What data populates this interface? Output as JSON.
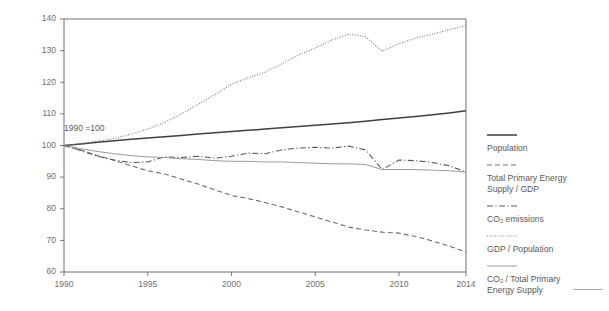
{
  "chart_data": {
    "type": "line",
    "title": "",
    "subtitle": "",
    "xlabel": "",
    "ylabel": "",
    "annotation": "1990 =100",
    "xlim": [
      1990,
      2014
    ],
    "ylim": [
      60,
      140
    ],
    "xticks": [
      1990,
      1995,
      2000,
      2005,
      2010,
      2014
    ],
    "xtick_labels": [
      "1990",
      "1995",
      "2000",
      "2005",
      "2010",
      "2014"
    ],
    "yticks": [
      60,
      70,
      80,
      90,
      100,
      110,
      120,
      130,
      140
    ],
    "ytick_labels": [
      "60",
      "70",
      "80",
      "90",
      "100",
      "110",
      "120",
      "130",
      "140"
    ],
    "grid": false,
    "legend_position": "right",
    "x": [
      1990,
      1991,
      1992,
      1993,
      1994,
      1995,
      1996,
      1997,
      1998,
      1999,
      2000,
      2001,
      2002,
      2003,
      2004,
      2005,
      2006,
      2007,
      2008,
      2009,
      2010,
      2011,
      2012,
      2013,
      2014
    ],
    "series": [
      {
        "name": "Population",
        "style": "solid",
        "color": "#3f3f3f",
        "width": 1.5,
        "values": [
          100.0,
          100.5,
          101.0,
          101.5,
          102.0,
          102.4,
          102.8,
          103.2,
          103.6,
          104.0,
          104.4,
          104.8,
          105.2,
          105.6,
          106.0,
          106.4,
          106.8,
          107.2,
          107.7,
          108.2,
          108.7,
          109.2,
          109.7,
          110.3,
          111.0
        ]
      },
      {
        "name": "Total Primary Energy Supply / GDP",
        "style": "dashed",
        "color": "#6d6e71",
        "width": 1.1,
        "values": [
          100.0,
          98.6,
          96.8,
          95.3,
          93.6,
          92.0,
          91.0,
          89.4,
          87.8,
          86.0,
          84.2,
          83.2,
          82.0,
          80.6,
          79.0,
          77.4,
          75.8,
          74.2,
          73.3,
          72.6,
          72.3,
          71.2,
          69.8,
          68.2,
          66.3
        ]
      },
      {
        "name": "CO2 emissions",
        "style": "dashdot",
        "color": "#58595b",
        "width": 1.1,
        "values": [
          100.0,
          98.4,
          96.6,
          95.4,
          94.6,
          94.8,
          96.4,
          96.2,
          96.6,
          96.0,
          96.6,
          97.6,
          97.4,
          98.6,
          99.2,
          99.4,
          99.2,
          99.8,
          98.6,
          92.4,
          95.4,
          95.2,
          94.6,
          93.6,
          91.6
        ]
      },
      {
        "name": "GDP / Population",
        "style": "dotted",
        "color": "#808285",
        "width": 1.2,
        "values": [
          100.0,
          100.6,
          101.4,
          102.2,
          103.6,
          105.2,
          107.2,
          110.0,
          113.0,
          116.0,
          119.4,
          121.4,
          123.2,
          125.8,
          128.6,
          130.8,
          133.4,
          135.2,
          134.4,
          129.8,
          132.2,
          134.0,
          135.2,
          136.6,
          138.0
        ]
      },
      {
        "name": "CO2 / Total Primary Energy Supply",
        "style": "solid-thin",
        "color": "#8c8e90",
        "width": 0.9,
        "values": [
          100.0,
          99.0,
          98.1,
          97.4,
          96.8,
          96.4,
          96.2,
          95.8,
          95.6,
          95.2,
          95.0,
          95.0,
          94.8,
          94.8,
          94.6,
          94.4,
          94.2,
          94.2,
          94.0,
          92.4,
          92.4,
          92.4,
          92.2,
          92.0,
          91.6
        ]
      }
    ],
    "legend": [
      {
        "label": "Population",
        "style": "solid"
      },
      {
        "label": "Total Primary Energy\nSupply / GDP",
        "style": "dashed"
      },
      {
        "label": "CO₂ emissions",
        "style": "dashdot"
      },
      {
        "label": "GDP / Population",
        "style": "dotted"
      },
      {
        "label": "CO₂ / Total Primary\nEnergy Supply",
        "style": "solid-thin"
      }
    ]
  }
}
